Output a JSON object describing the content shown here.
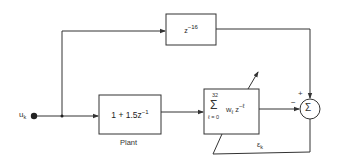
{
  "diagram": {
    "type": "block-diagram",
    "input": {
      "label": "u",
      "subscript": "k"
    },
    "delay_block": {
      "base": "z",
      "exponent": "−16"
    },
    "plant_block": {
      "expr_main": "1 + 1.5z",
      "exponent": "−1",
      "caption": "Plant"
    },
    "adaptive_filter": {
      "upper_limit": "32",
      "sigma": "Σ",
      "lower_limit": "ℓ = 0",
      "term_w": "w",
      "term_w_sub": "ℓ",
      "term_z": "z",
      "term_z_exp": "−ℓ"
    },
    "summing_junction": {
      "symbol": "Σ",
      "plus_sign": "+",
      "minus_sign": "−"
    },
    "error_signal": {
      "label": "ε",
      "subscript": "k"
    },
    "colors": {
      "line": "#333333",
      "background": "#ffffff"
    }
  }
}
